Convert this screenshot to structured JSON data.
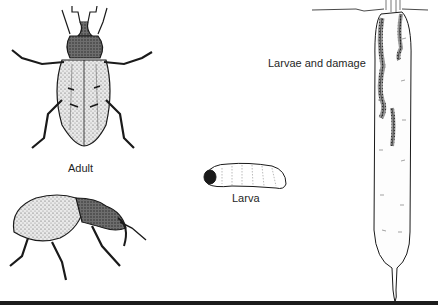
{
  "figure": {
    "labels": {
      "adult": "Adult",
      "larva": "Larva",
      "damage": "Larvae and damage"
    },
    "illustrations": [
      {
        "name": "adult-weevil-dorsal",
        "view": "top"
      },
      {
        "name": "adult-weevil-lateral",
        "view": "side"
      },
      {
        "name": "larva",
        "view": "side"
      },
      {
        "name": "carrot-root-with-larval-tunnels",
        "view": "cross-section"
      }
    ],
    "colors": {
      "ink": "#1a1a1a",
      "background": "#ffffff",
      "stipple": "#6b6b6b"
    }
  }
}
